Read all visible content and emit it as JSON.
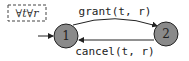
{
  "diagram": {
    "type": "state-automaton",
    "quantifier_box": {
      "text": "∀t∀r",
      "border_style": "dashed"
    },
    "states": [
      {
        "id": "1",
        "label": "1",
        "initial": true,
        "fill": "#8a8a8a"
      },
      {
        "id": "2",
        "label": "2",
        "initial": false,
        "fill": "#8a8a8a"
      }
    ],
    "transitions": [
      {
        "from": "1",
        "to": "2",
        "action": "grant",
        "args": "(t, r)",
        "label": "grant(t, r)"
      },
      {
        "from": "2",
        "to": "1",
        "action": "cancel",
        "args": "(t, r)",
        "label": "cancel(t, r)"
      }
    ],
    "colors": {
      "stroke": "#222222",
      "state_fill": "#8a8a8a",
      "text": "#222222"
    }
  }
}
